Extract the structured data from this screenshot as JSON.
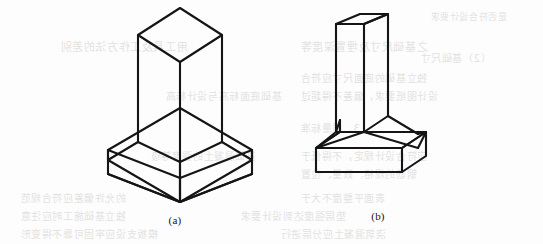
{
  "page": {
    "width": 543,
    "height": 244,
    "background_color": "#fdfdfd",
    "ink_color": "#151515",
    "bleed_color": "#d9d9d9",
    "kind": "scanned-book-page-figure"
  },
  "figures": [
    {
      "id": "figure-a",
      "caption": "(a)",
      "subject": "square column on stepped pedestal footing",
      "projection": "isometric",
      "caption_x": 175,
      "caption_y": 214
    },
    {
      "id": "figure-b",
      "caption": "(b)",
      "subject": "rectangular column on tapered slab footing",
      "projection": "oblique",
      "caption_x": 378,
      "caption_y": 210
    }
  ],
  "bleed_text": [
    {
      "text": "用工具及工作方法的差别",
      "x": 60,
      "y": 38,
      "size": 11
    },
    {
      "text": "之基础尺寸及埋置深度等",
      "x": 300,
      "y": 38,
      "size": 11
    },
    {
      "text": "是否符合设计要求",
      "x": 430,
      "y": 10,
      "size": 9
    },
    {
      "text": "（2）基础尺寸",
      "x": 420,
      "y": 50,
      "size": 10
    },
    {
      "text": "独立基础的底面尺寸应符合",
      "x": 300,
      "y": 70,
      "size": 10
    },
    {
      "text": "设计图纸要求，偏差不得超过",
      "x": 300,
      "y": 88,
      "size": 10
    },
    {
      "text": "基础底面标高与设计标高",
      "x": 165,
      "y": 88,
      "size": 10
    },
    {
      "text": "3．质量标准",
      "x": 300,
      "y": 120,
      "size": 10
    },
    {
      "text": "基础混凝土的强度等级",
      "x": 150,
      "y": 148,
      "size": 10
    },
    {
      "text": "应符合设计规定，不得低于",
      "x": 300,
      "y": 148,
      "size": 10
    },
    {
      "text": "钢筋的规格、数量、位置",
      "x": 300,
      "y": 166,
      "size": 10
    },
    {
      "text": "的允许偏差应符合规范",
      "x": 20,
      "y": 190,
      "size": 10
    },
    {
      "text": "表面平整度不大于",
      "x": 300,
      "y": 190,
      "size": 10
    },
    {
      "text": "独立基础施工时应注意",
      "x": 20,
      "y": 208,
      "size": 10
    },
    {
      "text": "垫层强度达到设计要求",
      "x": 240,
      "y": 208,
      "size": 10
    },
    {
      "text": "模板支设应牢固可靠不得变形",
      "x": 20,
      "y": 226,
      "size": 10
    },
    {
      "text": "浇筑混凝土应分层进行",
      "x": 280,
      "y": 226,
      "size": 10
    }
  ]
}
